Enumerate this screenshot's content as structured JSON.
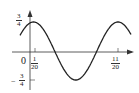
{
  "chart_data": {
    "type": "line",
    "title": "",
    "xlabel": "",
    "ylabel": "",
    "function": "y = (3/4) cos(4π(t − 1/20))",
    "amplitude": 0.75,
    "period": 0.5,
    "x_ticks": [
      "0",
      "1/20",
      "11/20"
    ],
    "y_ticks": [
      "3/4",
      "-3/4"
    ],
    "ylim": [
      -0.75,
      0.75
    ],
    "key_points": [
      {
        "x": 0.05,
        "y": 0.75,
        "note": "maximum"
      },
      {
        "x": 0.3,
        "y": -0.75,
        "note": "minimum"
      },
      {
        "x": 0.55,
        "y": 0.75,
        "note": "maximum"
      }
    ],
    "grid": false
  },
  "labels": {
    "origin": "0",
    "y_max": {
      "num": "3",
      "den": "4",
      "sign": ""
    },
    "y_min": {
      "num": "3",
      "den": "4",
      "sign": "−"
    },
    "x_tick1": {
      "num": "1",
      "den": "20"
    },
    "x_tick2": {
      "num": "11",
      "den": "20"
    }
  }
}
